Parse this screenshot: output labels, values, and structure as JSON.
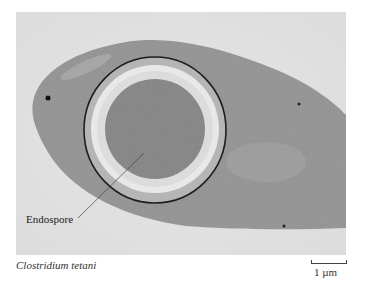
{
  "figure": {
    "labels": {
      "endospore": "Endospore"
    },
    "caption": "Clostridium tetani",
    "scale_bar": {
      "label": "1 µm"
    },
    "colors": {
      "background": "#e2e2e2",
      "cell_body": "#9c9c9c",
      "spore_wall_band": "#e8e8e8",
      "spore_core": "#8e8e8e",
      "outer_membrane": "#1e1e1e"
    }
  }
}
